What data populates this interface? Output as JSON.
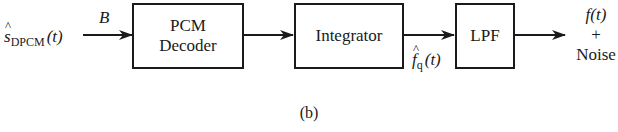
{
  "diagram": {
    "input": {
      "symbol": "s",
      "subscript": "DPCM",
      "arg": "(t)",
      "hat": true,
      "arrow_label": "B"
    },
    "blocks": [
      {
        "id": "pcm-decoder",
        "line1": "PCM",
        "line2": "Decoder"
      },
      {
        "id": "integrator",
        "line1": "Integrator"
      },
      {
        "id": "lpf",
        "line1": "LPF"
      }
    ],
    "intermediate": {
      "symbol": "f",
      "subscript": "q",
      "arg": "(t)",
      "hat": true
    },
    "output": {
      "line1": "f(t)",
      "line2": "+",
      "line3": "Noise"
    },
    "caption": "(b)",
    "colors": {
      "stroke": "#1a1a1a",
      "background": "#ffffff"
    }
  }
}
